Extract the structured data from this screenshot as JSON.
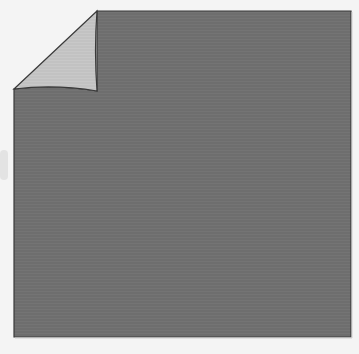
{
  "figure": {
    "colors": {
      "background": "#f4f4f4",
      "sheet": "#6e6e6e",
      "sheet_stripe": "#747474",
      "curl": "#c4c4c4",
      "outline": "#3a3a3a"
    }
  }
}
